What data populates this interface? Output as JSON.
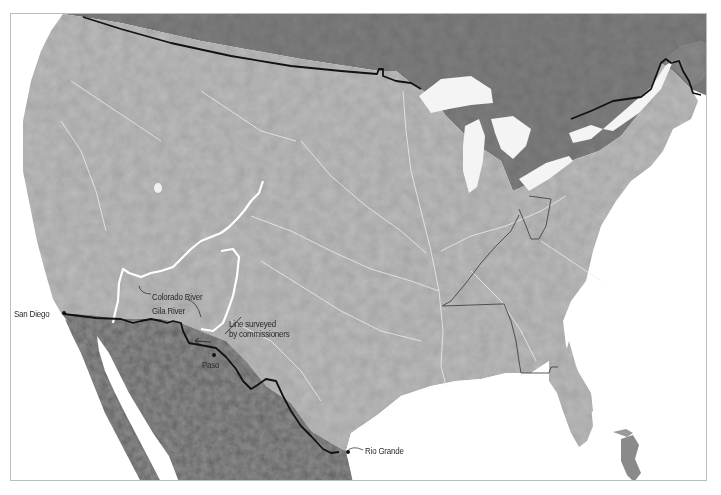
{
  "map": {
    "type": "shaded-relief",
    "region": "United States, southern Canada and northern Mexico",
    "colors": {
      "water": "#ffffff",
      "us_land": "#b9b9b9",
      "canada_land": "#7d7d7d",
      "mexico_land": "#8a8a8a",
      "international_border": "#111111",
      "state_border": "#444444",
      "rivers": "#ececec",
      "highlighted_rivers": "#ffffff",
      "frame": "#bdbdbd"
    },
    "labels": {
      "san_diego": "San Diego",
      "colorado_river": "Colorado River",
      "gila_river": "Gila River",
      "line_surveyed_1": "Line surveyed",
      "line_surveyed_2": "by commissioners",
      "paso": "Paso",
      "rio_grande": "Rio Grande"
    },
    "markers": [
      {
        "name": "San Diego",
        "x": 63,
        "y": 313
      },
      {
        "name": "Paso",
        "x": 213,
        "y": 354
      }
    ]
  }
}
